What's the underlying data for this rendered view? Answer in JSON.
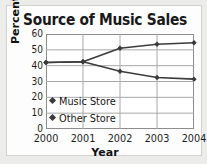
{
  "chart_data": {
    "type": "line",
    "title": "Source of Music Sales",
    "xlabel": "Year",
    "ylabel": "Percent",
    "categories": [
      "2000",
      "2001",
      "2002",
      "2003",
      "2004"
    ],
    "x": [
      2000,
      2001,
      2002,
      2003,
      2004
    ],
    "series": [
      {
        "name": "Music Store",
        "values": [
          42,
          42.5,
          51,
          53.5,
          54.5
        ],
        "marker": "diamond",
        "color": "#3b3b3b"
      },
      {
        "name": "Other Store",
        "values": [
          42,
          42.5,
          36.5,
          32.5,
          31.5
        ],
        "marker": "diamond",
        "color": "#3b3b3b"
      }
    ],
    "ylim": [
      0,
      60
    ],
    "yticks": [
      0,
      10,
      20,
      30,
      40,
      50,
      60
    ],
    "ytick_labels": [
      "0",
      "10",
      "20",
      "30",
      "40",
      "50",
      "60"
    ],
    "grid": "both",
    "legend_position": "inside-lower-left"
  },
  "style": {
    "page_background": "#ececeb",
    "card_background": "#fdfdfd",
    "card_border": "#d2d2d0",
    "axis_color": "#8d8d8d",
    "grid_color": "#a8a8a8",
    "line_color": "#3b3b3b",
    "text_color": "#1d1d1d"
  }
}
